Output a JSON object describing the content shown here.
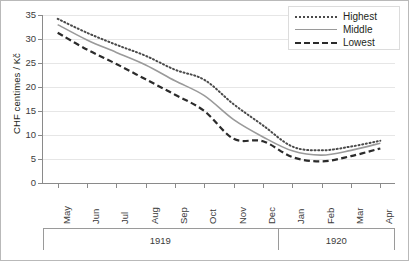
{
  "chart_data": {
    "type": "line",
    "title": "",
    "subtitle": "",
    "xlabel": "",
    "ylabel": "CHF centimes / Kč",
    "ylim": [
      0,
      35
    ],
    "yticks": [
      0,
      5,
      10,
      15,
      20,
      25,
      30,
      35
    ],
    "ytick_labels": [
      "0",
      "5",
      "10",
      "15",
      "20",
      "25",
      "30",
      "35"
    ],
    "grid": true,
    "grid_axis": "y",
    "legend_position": "top-right",
    "categories": [
      "May",
      "Jun",
      "Jul",
      "Aug",
      "Sep",
      "Oct",
      "Nov",
      "Dec",
      "Jan",
      "Feb",
      "Mar",
      "Apr"
    ],
    "x_group_labels": [
      "1919",
      "1920"
    ],
    "x_groups": [
      {
        "label": "1919",
        "months": [
          "May",
          "Jun",
          "Jul",
          "Aug",
          "Sep",
          "Oct",
          "Nov",
          "Dec"
        ]
      },
      {
        "label": "1920",
        "months": [
          "Jan",
          "Feb",
          "Mar",
          "Apr"
        ]
      }
    ],
    "series": [
      {
        "name": "Highest",
        "style": "dotted",
        "color": "#4a4a4a",
        "values": [
          34.2,
          31.3,
          28.8,
          26.5,
          23.6,
          21.5,
          16.4,
          12.0,
          7.6,
          6.8,
          7.6,
          8.8
        ]
      },
      {
        "name": "Middle",
        "style": "solid",
        "color": "#9a9a9a",
        "values": [
          33.0,
          29.8,
          27.2,
          24.6,
          21.3,
          18.2,
          13.2,
          9.6,
          6.7,
          5.8,
          6.8,
          8.3
        ]
      },
      {
        "name": "Lowest",
        "style": "dashed",
        "color": "#2b2b2b",
        "values": [
          31.3,
          27.8,
          24.8,
          21.6,
          18.4,
          15.0,
          9.2,
          8.7,
          5.4,
          4.5,
          5.6,
          7.2
        ]
      }
    ]
  },
  "legend": {
    "items": [
      {
        "label": "Highest",
        "swatch": "dotted-line-swatch"
      },
      {
        "label": "Middle",
        "swatch": "solid-line-swatch"
      },
      {
        "label": "Lowest",
        "swatch": "dashed-line-swatch"
      }
    ]
  },
  "axes": {
    "y_title": "CHF centimes / Kč",
    "y_tick_labels": [
      "35",
      "30",
      "25",
      "20",
      "15",
      "10",
      "5",
      "0"
    ],
    "x_tick_labels": [
      "May",
      "Jun",
      "Jul",
      "Aug",
      "Sep",
      "Oct",
      "Nov",
      "Dec",
      "Jan",
      "Feb",
      "Mar",
      "Apr"
    ],
    "year_labels": [
      "1919",
      "1920"
    ]
  },
  "colors": {
    "highest": "#4a4a4a",
    "middle": "#9a9a9a",
    "lowest": "#2b2b2b",
    "grid": "#e6e6e6",
    "axis": "#8a8a8a",
    "frame": "#b9b9b9",
    "text": "#231f20"
  }
}
